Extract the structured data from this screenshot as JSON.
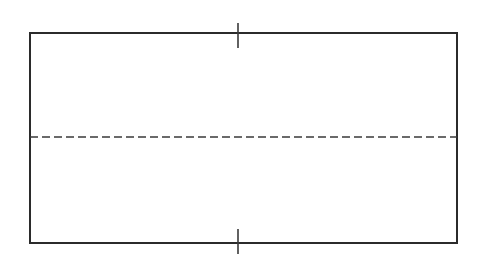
{
  "canvas": {
    "width": 489,
    "height": 274,
    "background_color": "#ffffff"
  },
  "drawing": {
    "type": "engineering-line-drawing",
    "description": "Plain rectangle outline with a horizontal dashed centerline and two short vertical center tick marks crossing the top and bottom edges",
    "has_text": false,
    "stroke_color": "#2b2b2b",
    "centerline_color": "#3a3a3a"
  },
  "rectangle": {
    "name": "outline-rectangle",
    "x": 30,
    "y": 33,
    "width": 427,
    "height": 210,
    "stroke_width": 2,
    "stroke_color": "#2b2b2b",
    "fill": "none"
  },
  "centerline": {
    "name": "horizontal-centerline",
    "orientation": "horizontal",
    "x1": 30,
    "y1": 137,
    "x2": 457,
    "y2": 137,
    "stroke_width": 1.6,
    "stroke_color": "#3a3a3a",
    "dash_length": 8,
    "gap_length": 4,
    "dash_pattern": "8 4"
  },
  "tick_marks": [
    {
      "name": "top-center-tick",
      "x": 238,
      "y1": 23,
      "y2": 48,
      "length": 25,
      "stroke_width": 1.6,
      "stroke_color": "#3a3a3a"
    },
    {
      "name": "bottom-center-tick",
      "x": 238,
      "y1": 229,
      "y2": 254,
      "length": 25,
      "stroke_width": 1.6,
      "stroke_color": "#3a3a3a"
    }
  ]
}
